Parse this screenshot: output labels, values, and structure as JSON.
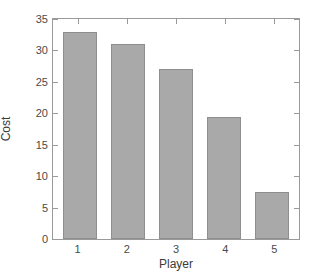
{
  "chart_data": {
    "type": "bar",
    "title": "",
    "subtitle": "",
    "categories": [
      "1",
      "2",
      "3",
      "4",
      "5"
    ],
    "values": [
      33,
      31,
      27,
      19.4,
      7.5
    ],
    "series": [
      {
        "name": "Cost",
        "values": [
          33,
          31,
          27,
          19.4,
          7.5
        ]
      }
    ],
    "xlabel": "Player",
    "ylabel": "Cost",
    "xlim": [
      0.5,
      5.5
    ],
    "ylim": [
      0,
      35
    ],
    "yticks": [
      0,
      5,
      10,
      15,
      20,
      25,
      30,
      35
    ],
    "ytick_labels": [
      "0",
      "5",
      "10",
      "15",
      "20",
      "25",
      "30",
      "35"
    ],
    "xticks": [
      1,
      2,
      3,
      4,
      5
    ],
    "xtick_labels": [
      "1",
      "2",
      "3",
      "4",
      "5"
    ],
    "grid": false,
    "legend": null,
    "legend_position": "none",
    "bar_color": "#a9a9a9",
    "bar_edge_color": "#8e8e8e",
    "axis_color": "#9a9a9a",
    "background_color": "#ffffff",
    "annotations": []
  }
}
